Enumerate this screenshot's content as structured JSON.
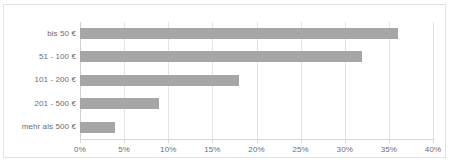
{
  "chart_data": {
    "type": "bar",
    "orientation": "horizontal",
    "title": "",
    "xlabel": "",
    "ylabel": "",
    "categories": [
      "bis 50 €",
      "51 - 100 €",
      "101 - 200 €",
      "201 - 500 €",
      "mehr als 500 €"
    ],
    "values": [
      36,
      32,
      18,
      9,
      4
    ],
    "value_suffix": "%",
    "xlim": [
      0,
      40
    ],
    "xticks": [
      0,
      5,
      10,
      15,
      20,
      25,
      30,
      35,
      40
    ],
    "xtick_labels": [
      "0%",
      "5%",
      "10%",
      "15%",
      "20%",
      "25%",
      "30%",
      "35%",
      "40%"
    ],
    "grid": true,
    "grid_axis": "x",
    "legend": false,
    "series": [
      {
        "name": "",
        "values": [
          36,
          32,
          18,
          9,
          4
        ]
      }
    ]
  },
  "style": {
    "bar_color": "#a6a6a6",
    "grid_color": "#e4e4e4",
    "axis_color": "#d8d8d8",
    "frame_color": "#e2e2e2",
    "text_color": "#6d6d6d",
    "background": "#ffffff"
  }
}
